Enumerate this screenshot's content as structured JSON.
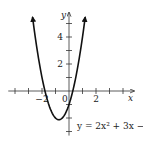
{
  "chart_data": {
    "type": "line",
    "title": "",
    "equation_label": "y = 2x² + 3x − 1",
    "equation": {
      "a": 2,
      "b": 3,
      "c": -1
    },
    "xlabel": "x",
    "ylabel": "y",
    "xlim": [
      -4.5,
      4.8
    ],
    "ylim": [
      -3.3,
      5.8
    ],
    "x_ticks": [
      -4,
      -3,
      -2,
      -1,
      1,
      2,
      3,
      4
    ],
    "y_ticks": [
      -3,
      -2,
      -1,
      1,
      2,
      3,
      4,
      5
    ],
    "x_tick_labels": [
      {
        "value": -2,
        "text": "−2"
      },
      {
        "value": 2,
        "text": "2"
      }
    ],
    "y_tick_labels": [
      {
        "value": 4,
        "text": "4"
      },
      {
        "value": 2,
        "text": "2"
      }
    ],
    "origin_label": "0",
    "grid": false,
    "series": [
      {
        "name": "y = 2x^2 + 3x - 1",
        "x_range": [
          -2.7,
          1.2
        ],
        "vertex": [
          -0.75,
          -2.125
        ],
        "roots": [
          -1.78,
          0.28
        ],
        "y_intercept": -1,
        "arrows_at_ends": true,
        "color": "#111111"
      }
    ]
  },
  "colors": {
    "curve": "#111111",
    "axis": "#333333",
    "background": "#ffffff"
  }
}
